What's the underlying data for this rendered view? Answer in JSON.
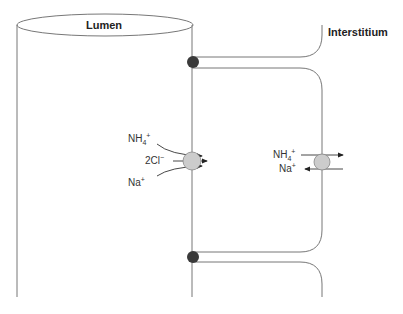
{
  "labels": {
    "lumen": "Lumen",
    "interstitium": "Interstitium"
  },
  "apical_transporter": {
    "ions": [
      {
        "base": "NH",
        "sub": "4",
        "sup": "+"
      },
      {
        "base": "2Cl",
        "sub": "",
        "sup": "−"
      },
      {
        "base": "Na",
        "sub": "",
        "sup": "+"
      }
    ],
    "direction": "lumen-to-cell"
  },
  "basolateral_transporter": {
    "ions": [
      {
        "base": "NH",
        "sub": "4",
        "sup": "+",
        "direction": "cell-to-interstitium"
      },
      {
        "base": "Na",
        "sub": "",
        "sup": "+",
        "direction": "interstitium-to-cell"
      }
    ]
  },
  "colors": {
    "line": "#777777",
    "junction": "#3a3a3a",
    "transporter_fill": "#cccccc",
    "text": "#333333"
  }
}
